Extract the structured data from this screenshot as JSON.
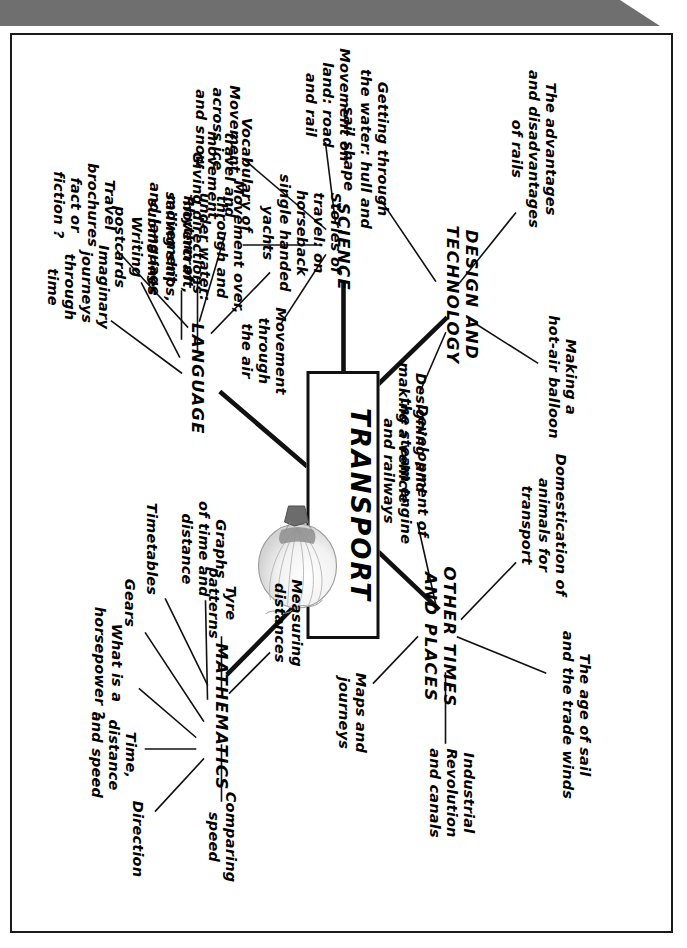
{
  "document": {
    "type": "mind-map",
    "center": {
      "label": "TRANSPORT",
      "illustration": "hot-air-balloon-icon"
    },
    "orientation": "page rotated 90 degrees (text reads bottom-to-top)",
    "branches": [
      {
        "id": "design-and-technology",
        "label": "DESIGN AND\nTECHNOLOGY",
        "children": [
          {
            "id": "advantages-rails",
            "label": "The advantages\nand disadvantages\nof rails"
          },
          {
            "id": "getting-through-water",
            "label": "Getting through\nthe water: hull and\nsail shape"
          },
          {
            "id": "making-hot-air-balloon",
            "label": "Making a\nhot-air balloon"
          },
          {
            "id": "designing-vehicle",
            "label": "Designing and\nmaking a vehicle"
          }
        ]
      },
      {
        "id": "other-times-and-places",
        "label": "OTHER TIMES\nAND PLACES",
        "children": [
          {
            "id": "age-of-sail",
            "label": "The age of sail\nand the trade winds"
          },
          {
            "id": "domestication-animals",
            "label": "Domestication of\nanimals for\ntransport"
          },
          {
            "id": "industrial-revolution",
            "label": "Industrial\nRevolution\nand canals"
          },
          {
            "id": "steam-engine-railways",
            "label": "Development of\nthe steam engine\nand railways"
          },
          {
            "id": "maps-and-journeys",
            "label": "Maps and\njourneys"
          }
        ]
      },
      {
        "id": "mathematics",
        "label": "MATHEMATICS",
        "children": [
          {
            "id": "measuring-distances",
            "label": "Measuring\ndistances"
          },
          {
            "id": "tyre-patterns",
            "label": "Tyre\npatterns"
          },
          {
            "id": "timetables",
            "label": "Timetables"
          },
          {
            "id": "comparing-speed",
            "label": "Comparing\nspeed"
          },
          {
            "id": "direction",
            "label": "Direction"
          },
          {
            "id": "time-distance-speed",
            "label": "Time,\ndistance\nand speed"
          },
          {
            "id": "what-is-horsepower",
            "label": "What is a\nhorsepower ?"
          },
          {
            "id": "gears",
            "label": "Gears"
          },
          {
            "id": "graphs-time-distance",
            "label": "Graphs\nof time and\ndistance"
          }
        ]
      },
      {
        "id": "language",
        "label": "LANGUAGE",
        "children": [
          {
            "id": "giving-directions",
            "label": "Giving directions"
          },
          {
            "id": "imaginary-journeys",
            "label": "Imaginary\njourneys\nthrough\ntime"
          },
          {
            "id": "writing-postcards",
            "label": "Writing\npostcards"
          },
          {
            "id": "rhythm-of-movement",
            "label": "Rhythm of\nmovement\nand language"
          },
          {
            "id": "travel-brochures",
            "label": "Travel\nbrochures\nfact or\nfiction ?"
          },
          {
            "id": "vocabulary-travel",
            "label": "Vocabulary of\ntravel and\nmovement"
          },
          {
            "id": "stories-of-travel",
            "label": "Stories of\ntravel: on\nhorseback\nsingle handed\nyachts"
          }
        ]
      },
      {
        "id": "science",
        "label": "SCIENCE",
        "children": [
          {
            "id": "movement-through-air",
            "label": "Movement\nthrough\nthe air"
          },
          {
            "id": "movement-water",
            "label": "Movement over,\nthrough and\nunder water:\nhovercraft,\nsailing ships,\nsubmarines"
          },
          {
            "id": "movement-ice-snow",
            "label": "Movement\nacross ice\nand snow"
          },
          {
            "id": "movement-on-land",
            "label": "Movement on\nland: road\nand rail"
          }
        ]
      }
    ],
    "colors": {
      "ink": "#111111",
      "paper": "#ffffff",
      "topbar": "#6f6f6f"
    }
  }
}
